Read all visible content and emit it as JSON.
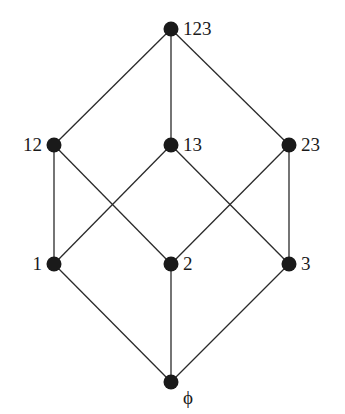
{
  "diagram": {
    "type": "hasse-diagram",
    "colors": {
      "node": "#1a1a1a",
      "edge": "#2a2a2a",
      "background": "#ffffff"
    },
    "nodes": [
      {
        "id": "123",
        "label": "123",
        "x": 171,
        "y": 29,
        "label_side": "right"
      },
      {
        "id": "12",
        "label": "12",
        "x": 54,
        "y": 145,
        "label_side": "left"
      },
      {
        "id": "13",
        "label": "13",
        "x": 171,
        "y": 145,
        "label_side": "right"
      },
      {
        "id": "23",
        "label": "23",
        "x": 289,
        "y": 145,
        "label_side": "right"
      },
      {
        "id": "1",
        "label": "1",
        "x": 54,
        "y": 264,
        "label_side": "left"
      },
      {
        "id": "2",
        "label": "2",
        "x": 171,
        "y": 264,
        "label_side": "right"
      },
      {
        "id": "3",
        "label": "3",
        "x": 289,
        "y": 264,
        "label_side": "right"
      },
      {
        "id": "empty",
        "label": "ϕ",
        "x": 171,
        "y": 382,
        "label_side": "right-below"
      }
    ],
    "edges": [
      [
        "123",
        "12"
      ],
      [
        "123",
        "13"
      ],
      [
        "123",
        "23"
      ],
      [
        "12",
        "1"
      ],
      [
        "12",
        "2"
      ],
      [
        "13",
        "1"
      ],
      [
        "13",
        "3"
      ],
      [
        "23",
        "2"
      ],
      [
        "23",
        "3"
      ],
      [
        "1",
        "empty"
      ],
      [
        "2",
        "empty"
      ],
      [
        "3",
        "empty"
      ]
    ]
  }
}
